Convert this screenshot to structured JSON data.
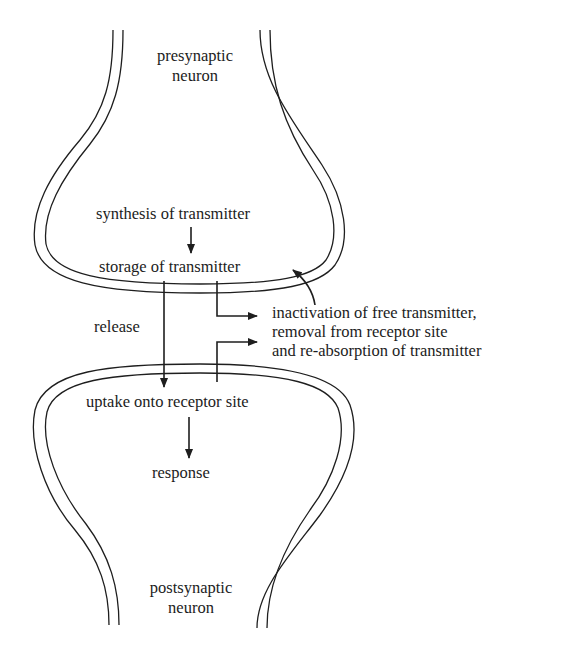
{
  "diagram": {
    "type": "synaptic transmission schematic",
    "stroke_color": "#1e1e1e",
    "background": "#ffffff",
    "labels": {
      "presynaptic": [
        "presynaptic",
        "neuron"
      ],
      "synthesis": "synthesis of transmitter",
      "storage": "storage of transmitter",
      "release": "release",
      "inactivation": [
        "inactivation of free transmitter,",
        "removal from receptor site",
        "and re-absorption of transmitter"
      ],
      "uptake": "uptake onto receptor site",
      "response": "response",
      "postsynaptic": [
        "postsynaptic",
        "neuron"
      ]
    },
    "flows": [
      {
        "from": "synthesis of transmitter",
        "to": "storage of transmitter"
      },
      {
        "from": "storage of transmitter",
        "to": "uptake onto receptor site",
        "label": "release"
      },
      {
        "from": "storage of transmitter",
        "to": "inactivation of free transmitter"
      },
      {
        "from": "uptake onto receptor site",
        "to": "inactivation of free transmitter"
      },
      {
        "from": "inactivation of free transmitter",
        "to": "storage of transmitter"
      },
      {
        "from": "uptake onto receptor site",
        "to": "response"
      }
    ]
  }
}
